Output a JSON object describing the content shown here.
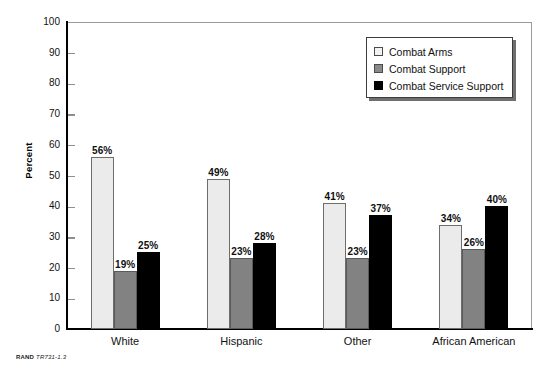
{
  "chart_data": {
    "type": "bar",
    "title": "",
    "xlabel": "",
    "ylabel": "Percent",
    "ylim": [
      0,
      100
    ],
    "ytick_step": 10,
    "yticks": [
      100,
      90,
      80,
      70,
      60,
      50,
      40,
      30,
      20,
      10,
      0
    ],
    "ytick_labels": [
      "100",
      "90",
      "80",
      "70",
      "60",
      "50",
      "40",
      "30",
      "20",
      "10",
      "0"
    ],
    "grid": false,
    "legend_position": "top-right",
    "categories": [
      "White",
      "Hispanic",
      "Other",
      "African American"
    ],
    "series": [
      {
        "name": "Combat Arms",
        "color": "#ebebeb",
        "values": [
          56,
          49,
          41,
          34
        ],
        "labels": [
          "56%",
          "49%",
          "41%",
          "34%"
        ]
      },
      {
        "name": "Combat Support",
        "color": "#828282",
        "values": [
          19,
          23,
          23,
          26
        ],
        "labels": [
          "19%",
          "23%",
          "23%",
          "26%"
        ]
      },
      {
        "name": "Combat Service Support",
        "color": "#000000",
        "values": [
          25,
          28,
          37,
          40
        ],
        "labels": [
          "25%",
          "28%",
          "37%",
          "40%"
        ]
      }
    ]
  },
  "axis": {
    "y_title": "Percent"
  },
  "legend": {
    "items": [
      {
        "label": "Combat Arms",
        "swatch": "legend-swatch-combat-arms"
      },
      {
        "label": "Combat Support",
        "swatch": "legend-swatch-combat-support"
      },
      {
        "label": "Combat Service Support",
        "swatch": "legend-swatch-combat-service-support"
      }
    ]
  },
  "caption": {
    "organization": "RAND",
    "figure_id": "TR731-1.3"
  }
}
